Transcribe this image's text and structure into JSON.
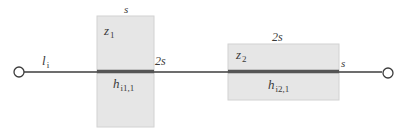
{
  "diagram": {
    "type": "link-with-zones",
    "colors": {
      "line": "#3c3c3c",
      "thick_segment": "#5a5a5a",
      "zone_fill": "#e6e6e6",
      "zone_stroke": "#cfcfcf",
      "node_fill": "#ffffff",
      "text": "#3a3a3a"
    },
    "link": {
      "label_main": "l",
      "label_sub": "i"
    },
    "nodes": [
      {
        "id": "start-node"
      },
      {
        "id": "end-node"
      }
    ],
    "zones": [
      {
        "name_main": "z",
        "name_sub": "1",
        "width_label": "s",
        "height_label": "2s",
        "segment_main": "h",
        "segment_sub": "i1,1"
      },
      {
        "name_main": "z",
        "name_sub": "2",
        "width_label": "2s",
        "height_label": "s",
        "segment_main": "h",
        "segment_sub": "i2,1"
      }
    ]
  }
}
